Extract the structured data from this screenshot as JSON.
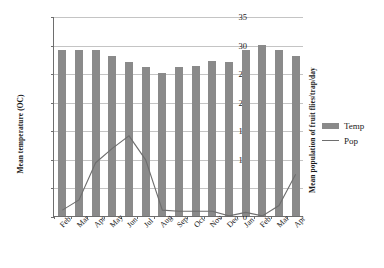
{
  "chart_data": {
    "type": "bar",
    "title": "",
    "subtitle": "",
    "xlabel": "",
    "ylabel": "Mean temperature (OC)",
    "y2label": "Mean population of fruit flies/trap/day",
    "categories": [
      "Feb",
      "Mar",
      "Apr",
      "May",
      "Jun",
      "Jul",
      "Aug",
      "Sep",
      "Oct",
      "Nov",
      "Dec",
      "Jan",
      "Feb",
      "Mar",
      "Apr"
    ],
    "ylim": [
      0,
      35
    ],
    "yticks": [
      0,
      5,
      10,
      15,
      20,
      25,
      30,
      35
    ],
    "grid": true,
    "legend_position": "right",
    "series": [
      {
        "name": "Temp",
        "kind": "bar",
        "color": "#8a8a8a",
        "axis": "left",
        "values": [
          29,
          29,
          29,
          28,
          27,
          26,
          25,
          26,
          26.3,
          27.2,
          27,
          29,
          30,
          29,
          28
        ]
      },
      {
        "name": "Pop",
        "kind": "line",
        "color": "#6e6e6e",
        "axis": "left",
        "values": [
          1.2,
          3.0,
          9.5,
          12.0,
          14.2,
          10.0,
          1.2,
          1.0,
          1.0,
          1.0,
          0.2,
          0.8,
          0.2,
          2.0,
          7.5
        ]
      }
    ]
  },
  "legend": {
    "entries": [
      {
        "label": "Temp",
        "marker": "bar-swatch"
      },
      {
        "label": "Pop",
        "marker": "line-swatch"
      }
    ]
  }
}
